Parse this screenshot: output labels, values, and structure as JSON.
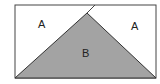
{
  "diagram": {
    "regions": [
      {
        "id": "left-top",
        "label": "A"
      },
      {
        "id": "right-top",
        "label": "A"
      },
      {
        "id": "triangle",
        "label": "B"
      }
    ],
    "colors": {
      "triangle_fill": "#a3a3a3",
      "outline": "#333333",
      "background": "#ffffff"
    }
  }
}
